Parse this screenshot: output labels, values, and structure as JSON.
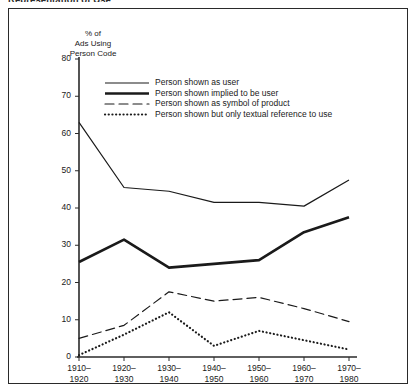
{
  "figure": {
    "clipped_title": "Representation of Use",
    "border_color": "#2a2a2a"
  },
  "chart_data": {
    "type": "line",
    "title": "Representation of Use",
    "xlabel": "",
    "ylabel": "% of\nAds Using\nPerson Code",
    "categories": [
      "1910–\n1920",
      "1920–\n1930",
      "1930–\n1940",
      "1940–\n1950",
      "1950–\n1960",
      "1960–\n1970",
      "1970–\n1980"
    ],
    "category_starts": [
      "1910–",
      "1920–",
      "1930–",
      "1940–",
      "1950–",
      "1960–",
      "1970–"
    ],
    "category_ends": [
      "1920",
      "1930",
      "1940",
      "1950",
      "1960",
      "1970",
      "1980"
    ],
    "ylim": [
      0,
      80
    ],
    "yticks": [
      0,
      10,
      20,
      30,
      40,
      50,
      60,
      70,
      80
    ],
    "grid": false,
    "legend_position": "top-center",
    "series": [
      {
        "name": "Person shown as user",
        "style": "solid-thin",
        "values": [
          63,
          45.5,
          44.5,
          41.5,
          41.5,
          40.5,
          47.5
        ]
      },
      {
        "name": "Person shown implied to be user",
        "style": "solid-thick",
        "values": [
          25.5,
          31.5,
          24,
          25,
          26,
          33.5,
          37.5
        ]
      },
      {
        "name": "Person shown as symbol of product",
        "style": "dashed",
        "values": [
          5,
          8.5,
          17.5,
          15,
          16,
          13,
          9.5
        ]
      },
      {
        "name": "Person shown but only textual reference to use",
        "style": "dotted",
        "values": [
          0.5,
          6,
          12,
          3,
          7,
          4.5,
          2
        ]
      }
    ]
  },
  "legend": {
    "entries": [
      {
        "label": "Person shown as user"
      },
      {
        "label": "Person shown implied to be user"
      },
      {
        "label": "Person shown as symbol of product"
      },
      {
        "label": "Person shown but only textual reference to use"
      }
    ]
  }
}
